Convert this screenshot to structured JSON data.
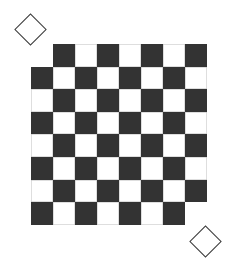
{
  "diagram": {
    "title": "",
    "type": "mutilated-chessboard",
    "rows": 8,
    "cols": 8,
    "removed_cells": [
      {
        "row": 0,
        "col": 0
      },
      {
        "row": 7,
        "col": 7
      }
    ],
    "dark_rule": "row+col odd",
    "colors": {
      "dark": "#333333",
      "light": "#ffffff",
      "outline": "#3a3a3a"
    },
    "geometry": {
      "origin_x": 31,
      "origin_y": 44,
      "cell_w": 22,
      "cell_h": 22.6
    },
    "removed_squares_markers": [
      {
        "name": "top-left-removed-square",
        "cx": 30,
        "cy": 29,
        "size": 23
      },
      {
        "name": "bottom-right-removed-square",
        "cx": 205,
        "cy": 241,
        "size": 23
      }
    ]
  }
}
